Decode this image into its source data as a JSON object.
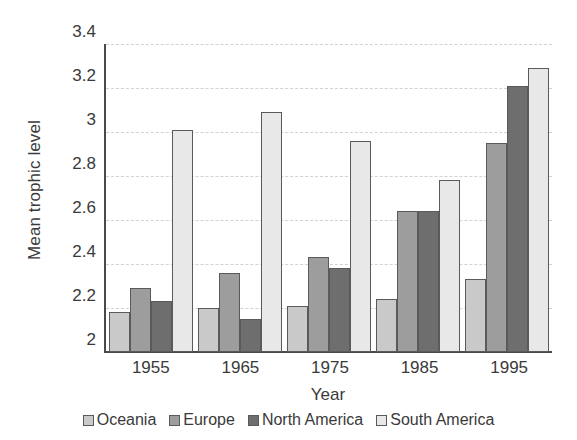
{
  "chart_data": {
    "type": "bar",
    "title": "",
    "xlabel": "Year",
    "ylabel": "Mean trophic level",
    "categories": [
      "1955",
      "1965",
      "1975",
      "1985",
      "1995"
    ],
    "series": [
      {
        "name": "Oceania",
        "color": "#c9c9c9",
        "values": [
          2.18,
          2.2,
          2.21,
          2.24,
          2.33
        ]
      },
      {
        "name": "Europe",
        "color": "#9d9d9d",
        "values": [
          2.29,
          2.36,
          2.43,
          2.64,
          2.95
        ]
      },
      {
        "name": "North America",
        "color": "#6e6e6e",
        "values": [
          2.23,
          2.15,
          2.38,
          2.64,
          3.21
        ]
      },
      {
        "name": "South America",
        "color": "#e8e8e8",
        "values": [
          3.01,
          3.09,
          2.96,
          2.78,
          3.29
        ]
      }
    ],
    "ylim": [
      2,
      3.4
    ],
    "yticks": [
      "2",
      "2.2",
      "2.4",
      "2.6",
      "2.8",
      "3",
      "3.2",
      "3.4"
    ],
    "ytick_values": [
      2,
      2.2,
      2.4,
      2.6,
      2.8,
      3,
      3.2,
      3.4
    ],
    "grid": true,
    "legend_position": "bottom"
  },
  "axes": {
    "y_title": "Mean trophic level",
    "x_title": "Year"
  }
}
